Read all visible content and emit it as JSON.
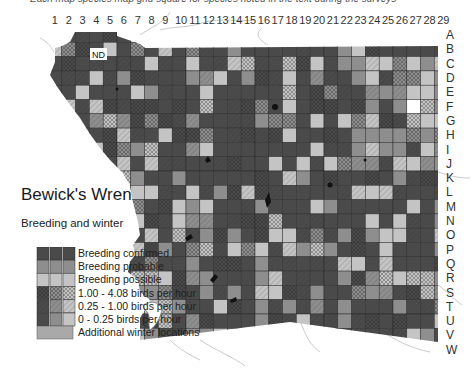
{
  "caption_cut": "Each map species map grid square for species noted in the text during the surveys",
  "map": {
    "title": "Bewick's Wren",
    "subtitle": "Breeding and winter",
    "nd_label": "ND",
    "columns": [
      "1",
      "2",
      "3",
      "4",
      "5",
      "6",
      "7",
      "8",
      "9",
      "10",
      "11",
      "12",
      "13",
      "14",
      "15",
      "16",
      "17",
      "18",
      "19",
      "20",
      "21",
      "22",
      "23",
      "24",
      "25",
      "26",
      "27",
      "28",
      "29"
    ],
    "rows": [
      "A",
      "B",
      "C",
      "D",
      "E",
      "F",
      "G",
      "H",
      "I",
      "J",
      "K",
      "L",
      "M",
      "N",
      "O",
      "P",
      "Q",
      "R",
      "S",
      "T",
      "U",
      "V",
      "W"
    ]
  },
  "legend": {
    "items": [
      {
        "label": "Breeding confirmed"
      },
      {
        "label": "Breeding probable"
      },
      {
        "label": "Breeding possible"
      },
      {
        "label": "1.00 - 4.08 birds per hour"
      },
      {
        "label": "0.25 - 1.00 birds per hour"
      },
      {
        "label": "0 - 0.25 birds per hour"
      },
      {
        "label": "Additional winter locations"
      }
    ]
  },
  "colors": {
    "confirmed": "#4a4a4a",
    "probable": "#8e8e8e",
    "possible": "#c4c4c4",
    "winter_only": "#a9a9a9",
    "grid_line": "#2b2b2b",
    "hatch": "#1e1e1e",
    "background": "#ffffff",
    "rivers": "#b8b8b8"
  }
}
